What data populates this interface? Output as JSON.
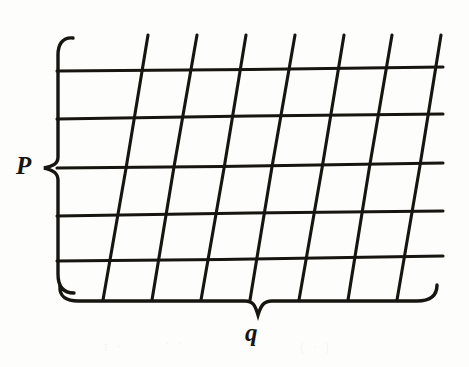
{
  "figure": {
    "kind": "scanned-textbook-figure",
    "background_color": "#fdfdfc",
    "ink_color": "#17150f",
    "width": 469,
    "height": 367,
    "labels": {
      "vertical_extent": "P",
      "horizontal_extent": "q"
    },
    "braces": {
      "left": {
        "name": "left-curly-brace",
        "orientation": "vertical",
        "top_y": 38,
        "bottom_y": 293,
        "spine_x": 58,
        "tip_x": 44,
        "tip_y": 168,
        "label": "P"
      },
      "bottom": {
        "name": "bottom-curly-brace",
        "orientation": "horizontal",
        "left_x": 60,
        "right_x": 437,
        "spine_y": 301,
        "tip_x": 258,
        "tip_y": 315,
        "label": "q"
      }
    },
    "grid": {
      "type": "skewed-lattice",
      "horizontal_line_count": 5,
      "slanted_line_count": 7,
      "horizontal_lines": [
        {
          "index": 0,
          "x_start": 57,
          "y_start": 71,
          "x_end": 443,
          "y_end": 67
        },
        {
          "index": 1,
          "x_start": 57,
          "y_start": 119,
          "x_end": 443,
          "y_end": 114
        },
        {
          "index": 2,
          "x_start": 57,
          "y_start": 168,
          "x_end": 443,
          "y_end": 163
        },
        {
          "index": 3,
          "x_start": 57,
          "y_start": 216,
          "x_end": 443,
          "y_end": 211
        },
        {
          "index": 4,
          "x_start": 57,
          "y_start": 261,
          "x_end": 443,
          "y_end": 256
        }
      ],
      "slanted_lines": [
        {
          "index": 0,
          "x_bottom": 103,
          "y_bottom": 300,
          "x_top": 148,
          "y_top": 35
        },
        {
          "index": 1,
          "x_bottom": 152,
          "y_bottom": 300,
          "x_top": 197,
          "y_top": 35
        },
        {
          "index": 2,
          "x_bottom": 201,
          "y_bottom": 300,
          "x_top": 246,
          "y_top": 35
        },
        {
          "index": 3,
          "x_bottom": 250,
          "y_bottom": 300,
          "x_top": 295,
          "y_top": 35
        },
        {
          "index": 4,
          "x_bottom": 299,
          "y_bottom": 300,
          "x_top": 344,
          "y_top": 35
        },
        {
          "index": 5,
          "x_bottom": 348,
          "y_bottom": 300,
          "x_top": 392,
          "y_top": 35
        },
        {
          "index": 6,
          "x_bottom": 397,
          "y_bottom": 300,
          "x_top": 441,
          "y_top": 35
        }
      ]
    },
    "scan_artifacts": [
      {
        "text": "t   ·",
        "left": 104,
        "top": 338,
        "size": 15
      },
      {
        "text": "·  ·",
        "left": 165,
        "top": 336,
        "size": 14
      },
      {
        "text": "( ·  )",
        "left": 300,
        "top": 340,
        "size": 14
      },
      {
        "text": "·",
        "left": 430,
        "top": 152,
        "size": 13
      }
    ]
  }
}
